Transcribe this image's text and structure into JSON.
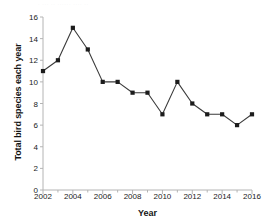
{
  "chart_data": {
    "type": "line",
    "title": "",
    "xlabel": "Year",
    "ylabel": "Total bird species each year",
    "x": [
      2002,
      2003,
      2004,
      2005,
      2006,
      2007,
      2008,
      2009,
      2010,
      2011,
      2012,
      2013,
      2014,
      2015,
      2016
    ],
    "values": [
      11,
      12,
      15,
      13,
      10,
      10,
      9,
      9,
      7,
      10,
      8,
      7,
      7,
      6,
      7
    ],
    "series": [
      {
        "name": "Total bird species each year",
        "values": [
          11,
          12,
          15,
          13,
          10,
          10,
          9,
          9,
          7,
          10,
          8,
          7,
          7,
          6,
          7
        ]
      }
    ],
    "xlim": [
      2002,
      2016
    ],
    "ylim": [
      0,
      16
    ],
    "ytick_labels": [
      "0",
      "2",
      "4",
      "6",
      "8",
      "10",
      "12",
      "14",
      "16"
    ],
    "ytick_values": [
      0,
      2,
      4,
      6,
      8,
      10,
      12,
      14,
      16
    ],
    "xtick_labels": [
      "2002",
      "2004",
      "2006",
      "2008",
      "2010",
      "2012",
      "2014",
      "2016"
    ],
    "xtick_values": [
      2002,
      2004,
      2006,
      2008,
      2010,
      2012,
      2014,
      2016
    ],
    "x_minor_ticks": [
      2003,
      2005,
      2007,
      2009,
      2011,
      2013,
      2015
    ],
    "grid": false,
    "legend": false,
    "legend_position": "none",
    "marker": "square",
    "marker_color": "#1c1c1c",
    "line_color": "#3b3b3b",
    "axis_color": "#b4b4b4",
    "background_color": "#ffffff"
  },
  "artifact": {
    "top_strip_text": "· ··· ·· ······ ···· ··"
  }
}
